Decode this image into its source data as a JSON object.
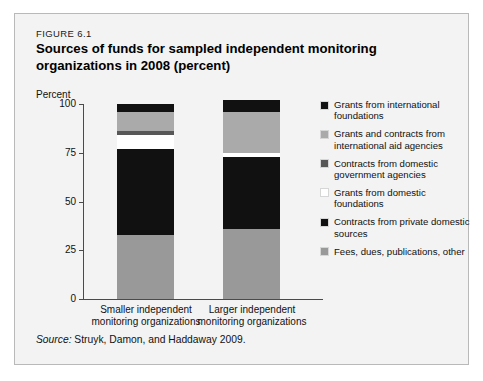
{
  "figure": {
    "number": "FIGURE 6.1",
    "title": "Sources of funds for sampled independent monitoring organizations in 2008 (percent)",
    "source_prefix": "Source:",
    "source_text": " Struyk, Damon, and Haddaway 2009."
  },
  "chart_data": {
    "type": "bar",
    "subtype": "stacked-vertical",
    "title": "Sources of funds for sampled independent monitoring organizations in 2008 (percent)",
    "xlabel": "",
    "ylabel": "Percent",
    "ylim": [
      0,
      100
    ],
    "yticks": [
      0,
      25,
      50,
      75,
      100
    ],
    "ytick_labels": [
      "0",
      "25",
      "50",
      "75",
      "100"
    ],
    "grid": false,
    "legend_position": "right",
    "categories": [
      "Smaller independent monitoring organizations",
      "Larger independent monitoring organizations"
    ],
    "category_labels": [
      [
        "Smaller independent",
        "monitoring organizations"
      ],
      [
        "Larger independent",
        "monitoring organizations"
      ]
    ],
    "series": [
      {
        "name": "Fees, dues, publications, other",
        "color": "#999999",
        "values": [
          33,
          36
        ]
      },
      {
        "name": "Contracts from private domestic sources",
        "color": "#111111",
        "values": [
          44,
          37
        ]
      },
      {
        "name": "Grants from domestic foundations",
        "color": "#ffffff",
        "values": [
          7,
          2
        ]
      },
      {
        "name": "Contracts from domestic government agencies",
        "color": "#575757",
        "values": [
          2,
          0
        ]
      },
      {
        "name": "Grants and contracts from international aid agencies",
        "color": "#aaaaaa",
        "values": [
          10,
          21
        ]
      },
      {
        "name": "Grants from international foundations",
        "color": "#111111",
        "values": [
          4,
          6
        ]
      }
    ],
    "stack_order_bottom_to_top": [
      "Fees, dues, publications, other",
      "Contracts from private domestic sources",
      "Grants from domestic foundations",
      "Contracts from domestic government agencies",
      "Grants and contracts from international aid agencies",
      "Grants from international foundations"
    ]
  },
  "legend": {
    "items": [
      {
        "label": "Grants from international foundations",
        "color": "#111111"
      },
      {
        "label": "Grants and contracts from international aid agencies",
        "color": "#aaaaaa"
      },
      {
        "label": "Contracts from domestic government agencies",
        "color": "#575757"
      },
      {
        "label": "Grants from domestic foundations",
        "color": "#ffffff"
      },
      {
        "label": "Contracts from private domestic sources",
        "color": "#111111"
      },
      {
        "label": "Fees, dues, publications, other",
        "color": "#999999"
      }
    ]
  }
}
